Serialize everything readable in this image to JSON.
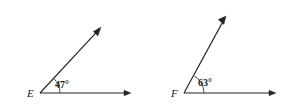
{
  "diagram": {
    "background_color": "#ffffff",
    "stroke_color": "#232323",
    "figures": [
      {
        "id": "angle-e",
        "vertex_label": "E",
        "angle_label": "47°",
        "angle_degrees": 47,
        "vertex": {
          "x": 40,
          "y": 93
        },
        "horizontal_ray": {
          "tip_x": 131,
          "tip_y": 93,
          "direction": "right"
        },
        "slanted_ray": {
          "tip_x": 101,
          "tip_y": 27,
          "direction": "up-right"
        },
        "arc_radius": 20,
        "vertex_label_pos": {
          "x": 27,
          "y": 97
        },
        "angle_label_pos": {
          "x": 55,
          "y": 88
        }
      },
      {
        "id": "angle-f",
        "vertex_label": "F",
        "angle_label": "63°",
        "angle_degrees": 63,
        "vertex": {
          "x": 184,
          "y": 93
        },
        "horizontal_ray": {
          "tip_x": 276,
          "tip_y": 93,
          "direction": "right"
        },
        "slanted_ray": {
          "tip_x": 226,
          "tip_y": 16,
          "direction": "up-right"
        },
        "arc_radius": 20,
        "vertex_label_pos": {
          "x": 171,
          "y": 97
        },
        "angle_label_pos": {
          "x": 198,
          "y": 86
        }
      }
    ]
  }
}
